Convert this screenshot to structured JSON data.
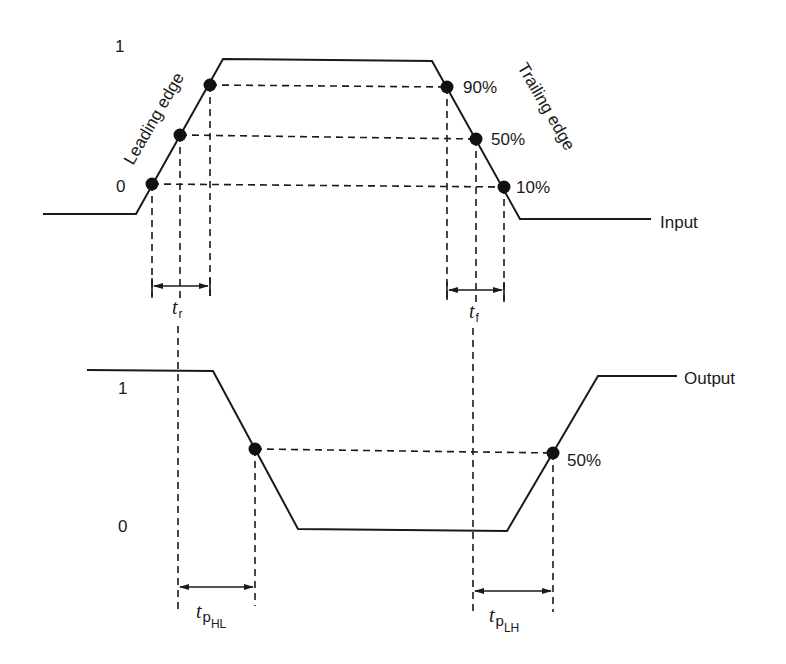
{
  "diagram": {
    "type": "timing-diagram",
    "input": {
      "label": "Input",
      "level_high_label": "1",
      "level_low_label": "0",
      "leading_edge_label": "Leading edge",
      "trailing_edge_label": "Trailing edge",
      "percent_labels": [
        "90%",
        "50%",
        "10%"
      ]
    },
    "rise_time": {
      "symbol": "t",
      "subscript": "r"
    },
    "fall_time": {
      "symbol": "t",
      "subscript": "f"
    },
    "output": {
      "label": "Output",
      "level_high_label": "1",
      "level_low_label": "0",
      "percent_label": "50%"
    },
    "prop_delay_hl": {
      "symbol": "t",
      "subscript": "p",
      "sub_subscript": "HL"
    },
    "prop_delay_lh": {
      "symbol": "t",
      "subscript": "p",
      "sub_subscript": "LH"
    }
  }
}
